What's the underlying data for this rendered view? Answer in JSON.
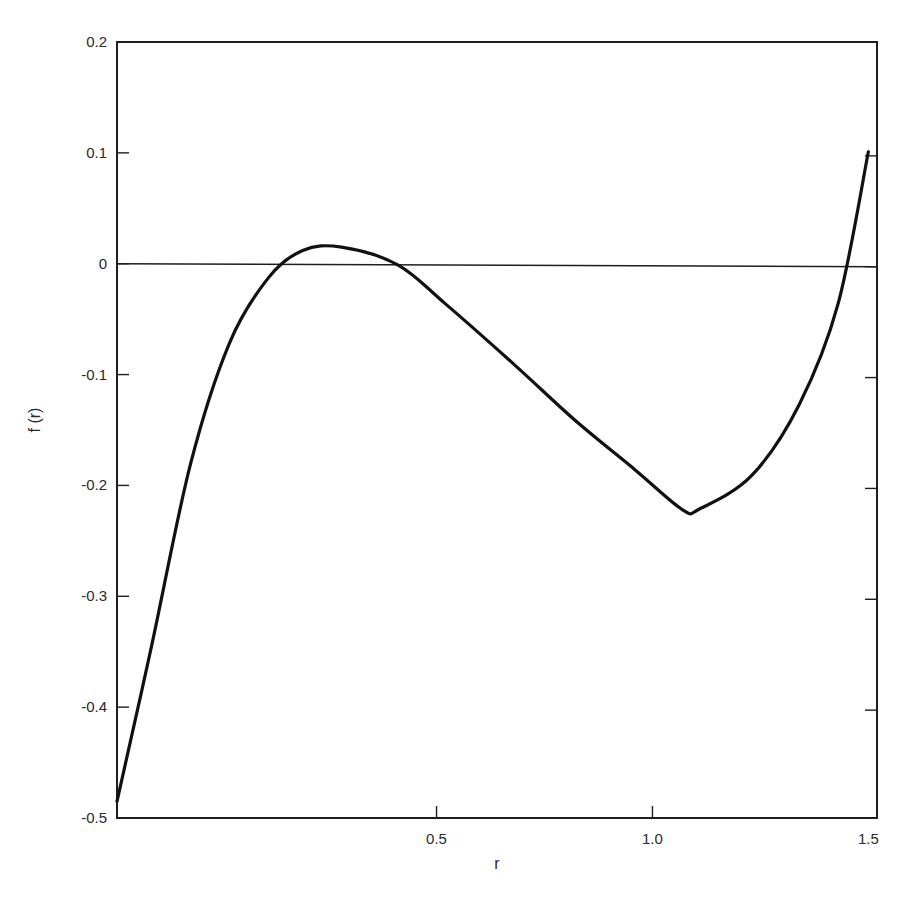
{
  "chart_data": {
    "type": "line",
    "title": "",
    "xlabel": "r",
    "ylabel": "f (r)",
    "xlim": [
      -0.24,
      1.52
    ],
    "ylim": [
      -0.5,
      0.2
    ],
    "grid": false,
    "legend": null,
    "x_ticks": [
      {
        "value": 0.5,
        "label": "0.5"
      },
      {
        "value": 1.0,
        "label": "1.0"
      },
      {
        "value": 1.5,
        "label": "1.5"
      }
    ],
    "y_ticks": [
      {
        "value": 0.2,
        "label": "0.2"
      },
      {
        "value": 0.1,
        "label": "0.1"
      },
      {
        "value": 0.0,
        "label": "0"
      },
      {
        "value": -0.1,
        "label": "-0.1"
      },
      {
        "value": -0.2,
        "label": "-0.2"
      },
      {
        "value": -0.3,
        "label": "-0.3"
      },
      {
        "value": -0.4,
        "label": "-0.4"
      },
      {
        "value": -0.5,
        "label": "-0.5"
      }
    ],
    "reference_lines": [
      {
        "type": "horizontal",
        "y": 0
      }
    ],
    "series": [
      {
        "name": "f(r)",
        "x": [
          -0.24,
          -0.16,
          -0.07,
          0.02,
          0.11,
          0.19,
          0.28,
          0.41,
          0.52,
          0.68,
          0.82,
          0.96,
          1.07,
          1.11,
          1.23,
          1.34,
          1.43,
          1.5
        ],
        "values": [
          -0.485,
          -0.345,
          -0.181,
          -0.072,
          -0.013,
          0.012,
          0.015,
          -0.001,
          -0.036,
          -0.091,
          -0.141,
          -0.186,
          -0.222,
          -0.221,
          -0.191,
          -0.127,
          -0.036,
          0.101
        ]
      }
    ],
    "annotations": []
  }
}
